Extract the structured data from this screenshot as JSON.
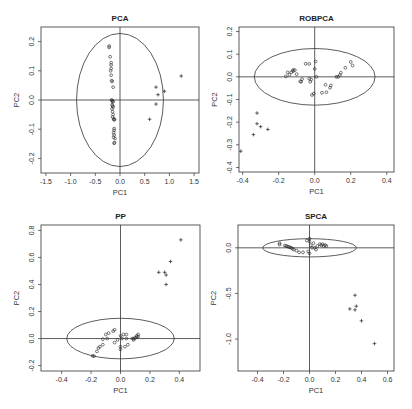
{
  "figure": {
    "width": 412,
    "height": 409,
    "panels_layout": "2x2"
  },
  "chart_data": [
    {
      "type": "scatter",
      "title": "PCA",
      "xlabel": "PC1",
      "ylabel": "PC2",
      "xlim": [
        -1.6,
        1.6
      ],
      "ylim": [
        -0.25,
        0.25
      ],
      "xticks": [
        "-1.5",
        "-1.0",
        "-0.5",
        "0.0",
        "0.5",
        "1.0",
        "1.5"
      ],
      "xtick_values": [
        -1.5,
        -1.0,
        -0.5,
        0.0,
        0.5,
        1.0,
        1.5
      ],
      "yticks": [
        "-0.2",
        "-0.1",
        "0.0",
        "0.1",
        "0.2"
      ],
      "ytick_values": [
        -0.2,
        -0.1,
        0.0,
        0.1,
        0.2
      ],
      "grid": false,
      "reference_lines": {
        "h": 0,
        "v": 0
      },
      "ellipse": {
        "cx": 0.0,
        "cy": 0.0,
        "rx": 0.88,
        "ry": 0.228
      },
      "box_px": {
        "x0": 41,
        "y0": 27,
        "x1": 199,
        "y1": 173
      },
      "series": [
        {
          "name": "regular",
          "marker": "circle",
          "points": [
            [
              -0.22,
              0.185
            ],
            [
              -0.22,
              0.18
            ],
            [
              -0.2,
              0.148
            ],
            [
              -0.18,
              0.128
            ],
            [
              -0.18,
              0.12
            ],
            [
              -0.18,
              0.108
            ],
            [
              -0.19,
              0.1
            ],
            [
              -0.18,
              0.085
            ],
            [
              -0.17,
              0.066
            ],
            [
              -0.16,
              0.064
            ],
            [
              -0.14,
              0.044
            ],
            [
              -0.17,
              0.0
            ],
            [
              -0.16,
              -0.002
            ],
            [
              -0.15,
              -0.004
            ],
            [
              -0.14,
              -0.006
            ],
            [
              -0.16,
              -0.016
            ],
            [
              -0.15,
              -0.02
            ],
            [
              -0.14,
              -0.024
            ],
            [
              -0.16,
              -0.03
            ],
            [
              -0.15,
              -0.04
            ],
            [
              -0.14,
              -0.05
            ],
            [
              -0.15,
              -0.058
            ],
            [
              -0.13,
              -0.065
            ],
            [
              -0.12,
              -0.068
            ],
            [
              -0.11,
              -0.066
            ],
            [
              -0.12,
              -0.098
            ],
            [
              -0.12,
              -0.104
            ],
            [
              -0.13,
              -0.112
            ],
            [
              -0.12,
              -0.12
            ],
            [
              -0.13,
              -0.128
            ],
            [
              -0.1,
              -0.132
            ],
            [
              -0.11,
              -0.146
            ],
            [
              -0.12,
              -0.148
            ]
          ]
        },
        {
          "name": "outliers",
          "marker": "plus",
          "points": [
            [
              1.24,
              0.082
            ],
            [
              0.73,
              0.044
            ],
            [
              0.9,
              0.03
            ],
            [
              0.77,
              0.018
            ],
            [
              0.73,
              -0.014
            ],
            [
              0.6,
              -0.066
            ]
          ]
        }
      ]
    },
    {
      "type": "scatter",
      "title": "ROBPCA",
      "xlabel": "PC1",
      "ylabel": "PC2",
      "xlim": [
        -0.42,
        0.44
      ],
      "ylim": [
        -0.42,
        0.22
      ],
      "xticks": [
        "-0.4",
        "-0.2",
        "0.0",
        "0.2",
        "0.4"
      ],
      "xtick_values": [
        -0.4,
        -0.2,
        0.0,
        0.2,
        0.4
      ],
      "yticks": [
        "-0.4",
        "-0.3",
        "-0.2",
        "-0.1",
        "0.0",
        "0.1",
        "0.2"
      ],
      "ytick_values": [
        -0.4,
        -0.3,
        -0.2,
        -0.1,
        0.0,
        0.1,
        0.2
      ],
      "grid": false,
      "reference_lines": {
        "h": 0,
        "v": 0
      },
      "ellipse": {
        "cx": 0.0,
        "cy": 0.0,
        "rx": 0.335,
        "ry": 0.125
      },
      "box_px": {
        "x0": 239,
        "y0": 27,
        "x1": 394,
        "y1": 172
      },
      "series": [
        {
          "name": "regular",
          "marker": "circle",
          "points": [
            [
              -0.16,
              0.002
            ],
            [
              -0.15,
              0.02
            ],
            [
              -0.14,
              0.01
            ],
            [
              -0.13,
              0.02
            ],
            [
              -0.12,
              0.025
            ],
            [
              -0.11,
              0.03
            ],
            [
              -0.12,
              0.03
            ],
            [
              -0.1,
              0.012
            ],
            [
              -0.08,
              -0.02
            ],
            [
              -0.07,
              -0.01
            ],
            [
              -0.075,
              -0.022
            ],
            [
              -0.05,
              0.058
            ],
            [
              -0.03,
              0.057
            ],
            [
              -0.03,
              -0.008
            ],
            [
              -0.02,
              -0.012
            ],
            [
              -0.025,
              -0.022
            ],
            [
              0.0,
              0.035
            ],
            [
              0.005,
              0.068
            ],
            [
              0.01,
              0.0
            ],
            [
              -0.015,
              -0.08
            ],
            [
              -0.005,
              -0.074
            ],
            [
              0.04,
              -0.07
            ],
            [
              0.06,
              -0.035
            ],
            [
              0.065,
              -0.068
            ],
            [
              0.085,
              -0.048
            ],
            [
              0.09,
              -0.038
            ],
            [
              0.12,
              0.0
            ],
            [
              0.13,
              0.0
            ],
            [
              0.14,
              0.008
            ],
            [
              0.145,
              0.018
            ],
            [
              0.17,
              0.04
            ],
            [
              0.2,
              0.066
            ],
            [
              0.21,
              0.05
            ]
          ]
        },
        {
          "name": "outliers",
          "marker": "plus",
          "points": [
            [
              -0.32,
              -0.16
            ],
            [
              -0.32,
              -0.207
            ],
            [
              -0.3,
              -0.22
            ],
            [
              -0.26,
              -0.232
            ],
            [
              -0.34,
              -0.255
            ],
            [
              -0.41,
              -0.328
            ]
          ]
        }
      ]
    },
    {
      "type": "scatter",
      "title": "PP",
      "xlabel": "PC1",
      "ylabel": "PC2",
      "xlim": [
        -0.54,
        0.54
      ],
      "ylim": [
        -0.24,
        0.84
      ],
      "xticks": [
        "-0.4",
        "-0.2",
        "0.0",
        "0.2",
        "0.4"
      ],
      "xtick_values": [
        -0.4,
        -0.2,
        0.0,
        0.2,
        0.4
      ],
      "yticks": [
        "-0.2",
        "0.0",
        "0.2",
        "0.4",
        "0.6",
        "0.8"
      ],
      "ytick_values": [
        -0.2,
        0.0,
        0.2,
        0.4,
        0.6,
        0.8
      ],
      "grid": false,
      "reference_lines": {
        "h": 0,
        "v": 0
      },
      "ellipse": {
        "cx": 0.0,
        "cy": 0.0,
        "rx": 0.365,
        "ry": 0.15
      },
      "box_px": {
        "x0": 41,
        "y0": 225,
        "x1": 200,
        "y1": 371
      },
      "series": [
        {
          "name": "regular",
          "marker": "circle",
          "points": [
            [
              -0.18,
              -0.13
            ],
            [
              -0.19,
              -0.128
            ],
            [
              -0.16,
              -0.095
            ],
            [
              -0.15,
              -0.07
            ],
            [
              -0.14,
              -0.06
            ],
            [
              -0.12,
              -0.045
            ],
            [
              -0.12,
              -0.005
            ],
            [
              -0.1,
              0.03
            ],
            [
              -0.09,
              0.0
            ],
            [
              -0.08,
              0.04
            ],
            [
              -0.05,
              0.055
            ],
            [
              -0.04,
              0.065
            ],
            [
              -0.04,
              -0.03
            ],
            [
              -0.02,
              -0.01
            ],
            [
              0.0,
              -0.06
            ],
            [
              0.0,
              -0.08
            ],
            [
              0.0,
              0.02
            ],
            [
              0.01,
              0.0
            ],
            [
              0.02,
              0.03
            ],
            [
              0.03,
              -0.06
            ],
            [
              0.04,
              0.03
            ],
            [
              0.04,
              0.0
            ],
            [
              0.05,
              -0.045
            ],
            [
              0.08,
              0.0
            ],
            [
              0.09,
              -0.01
            ],
            [
              0.09,
              0.0
            ],
            [
              0.1,
              0.005
            ],
            [
              0.11,
              0.01
            ],
            [
              0.11,
              0.02
            ],
            [
              0.12,
              0.03
            ],
            [
              0.12,
              0.015
            ]
          ]
        },
        {
          "name": "outliers",
          "marker": "plus",
          "points": [
            [
              0.41,
              0.73
            ],
            [
              0.34,
              0.57
            ],
            [
              0.26,
              0.49
            ],
            [
              0.3,
              0.49
            ],
            [
              0.31,
              0.47
            ],
            [
              0.31,
              0.4
            ]
          ]
        }
      ]
    },
    {
      "type": "scatter",
      "title": "SPCA",
      "xlabel": "PC1",
      "ylabel": "PC2",
      "xlim": [
        -0.55,
        0.65
      ],
      "ylim": [
        -1.35,
        0.25
      ],
      "xticks": [
        "-0.4",
        "-0.2",
        "0.0",
        "0.2",
        "0.4",
        "0.6"
      ],
      "xtick_values": [
        -0.4,
        -0.2,
        0.0,
        0.2,
        0.4,
        0.6
      ],
      "yticks": [
        "-1.0",
        "-0.5",
        "0.0"
      ],
      "ytick_values": [
        -1.0,
        -0.5,
        0.0
      ],
      "grid": false,
      "reference_lines": {
        "h": 0,
        "v": 0
      },
      "ellipse": {
        "cx": 0.0,
        "cy": 0.0,
        "rx": 0.36,
        "ry": 0.1
      },
      "box_px": {
        "x0": 238,
        "y0": 225,
        "x1": 394,
        "y1": 371
      },
      "series": [
        {
          "name": "regular",
          "marker": "circle",
          "points": [
            [
              -0.23,
              0.05
            ],
            [
              -0.23,
              0.035
            ],
            [
              -0.19,
              0.025
            ],
            [
              -0.18,
              0.02
            ],
            [
              -0.17,
              0.015
            ],
            [
              -0.16,
              0.01
            ],
            [
              -0.15,
              0.005
            ],
            [
              -0.14,
              0.0
            ],
            [
              -0.13,
              -0.01
            ],
            [
              -0.12,
              -0.02
            ],
            [
              -0.1,
              -0.03
            ],
            [
              -0.08,
              -0.05
            ],
            [
              -0.05,
              -0.05
            ],
            [
              -0.02,
              0.08
            ],
            [
              0.0,
              0.1
            ],
            [
              0.0,
              0.07
            ],
            [
              0.01,
              0.03
            ],
            [
              0.02,
              0.0
            ],
            [
              -0.01,
              -0.04
            ],
            [
              0.0,
              -0.06
            ],
            [
              0.03,
              0.05
            ],
            [
              0.04,
              0.0
            ],
            [
              0.05,
              -0.02
            ],
            [
              0.06,
              0.02
            ],
            [
              0.08,
              0.04
            ],
            [
              0.09,
              0.03
            ],
            [
              0.1,
              0.04
            ],
            [
              0.11,
              0.02
            ],
            [
              0.12,
              0.03
            ],
            [
              0.13,
              0.02
            ]
          ]
        },
        {
          "name": "outliers",
          "marker": "plus",
          "points": [
            [
              0.35,
              -0.52
            ],
            [
              0.36,
              -0.64
            ],
            [
              0.31,
              -0.67
            ],
            [
              0.35,
              -0.68
            ],
            [
              0.4,
              -0.8
            ],
            [
              0.5,
              -1.05
            ]
          ]
        }
      ]
    }
  ]
}
